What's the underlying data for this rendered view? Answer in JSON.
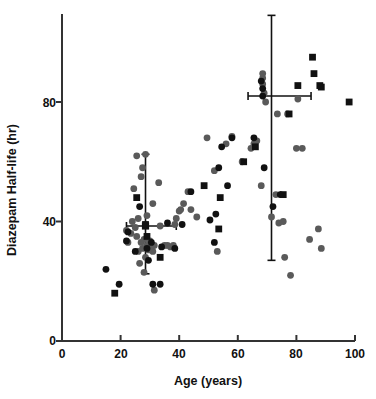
{
  "chart_data": {
    "type": "scatter",
    "title": "",
    "xlabel": "Age (years)",
    "ylabel": "Diazepam Half-life (hr)",
    "xlim": [
      0,
      100
    ],
    "ylim": [
      0,
      100
    ],
    "xticks": [
      0,
      20,
      40,
      60,
      80,
      100
    ],
    "yticks": [
      0,
      40,
      80
    ],
    "grid": false,
    "legend": "none",
    "series": [
      {
        "name": "gray-circles",
        "marker": "circle",
        "color": "#5a5a5a",
        "points": [
          [
            22.0,
            37.0
          ],
          [
            22.5,
            33.0
          ],
          [
            23.5,
            36.0
          ],
          [
            24.0,
            40.0
          ],
          [
            24.5,
            51.0
          ],
          [
            25.0,
            38.0
          ],
          [
            25.5,
            35.0
          ],
          [
            25.5,
            62.0
          ],
          [
            26.0,
            30.0
          ],
          [
            26.0,
            41.0
          ],
          [
            26.5,
            26.0
          ],
          [
            27.0,
            33.0
          ],
          [
            27.0,
            55.0
          ],
          [
            27.5,
            31.0
          ],
          [
            27.5,
            58.0
          ],
          [
            28.0,
            23.0
          ],
          [
            28.0,
            34.0
          ],
          [
            28.5,
            28.0
          ],
          [
            28.5,
            62.5
          ],
          [
            29.0,
            32.0
          ],
          [
            29.0,
            42.0
          ],
          [
            29.5,
            30.5
          ],
          [
            30.0,
            33.5
          ],
          [
            30.5,
            31.0
          ],
          [
            31.0,
            30.0
          ],
          [
            31.0,
            46.0
          ],
          [
            31.5,
            32.0
          ],
          [
            31.5,
            17.0
          ],
          [
            33.0,
            53.0
          ],
          [
            33.5,
            38.5
          ],
          [
            35.0,
            32.0
          ],
          [
            36.0,
            32.0
          ],
          [
            37.0,
            31.5
          ],
          [
            38.0,
            32.0
          ],
          [
            38.5,
            39.0
          ],
          [
            39.0,
            41.0
          ],
          [
            40.0,
            43.5
          ],
          [
            40.5,
            44.0
          ],
          [
            41.5,
            46.0
          ],
          [
            43.0,
            50.0
          ],
          [
            44.0,
            44.0
          ],
          [
            46.0,
            41.5
          ],
          [
            49.5,
            68.0
          ],
          [
            52.0,
            57.0
          ],
          [
            53.0,
            30.0
          ],
          [
            56.0,
            66.0
          ],
          [
            58.0,
            68.5
          ],
          [
            61.5,
            60.0
          ],
          [
            64.5,
            64.5
          ],
          [
            65.5,
            66.0
          ],
          [
            66.5,
            67.0
          ],
          [
            68.0,
            52.0
          ],
          [
            68.5,
            86.0
          ],
          [
            68.5,
            88.0
          ],
          [
            68.5,
            89.5
          ],
          [
            69.0,
            83.0
          ],
          [
            69.5,
            80.0
          ],
          [
            71.5,
            41.5
          ],
          [
            73.0,
            49.0
          ],
          [
            73.5,
            76.0
          ],
          [
            74.0,
            39.5
          ],
          [
            75.5,
            40.0
          ],
          [
            76.0,
            28.0
          ],
          [
            77.0,
            76.0
          ],
          [
            78.0,
            22.0
          ],
          [
            80.0,
            64.5
          ],
          [
            80.5,
            81.0
          ],
          [
            82.0,
            64.5
          ],
          [
            84.5,
            34.0
          ],
          [
            87.5,
            37.5
          ],
          [
            88.5,
            31.0
          ]
        ]
      },
      {
        "name": "black-circles",
        "marker": "circle",
        "color": "#111111",
        "points": [
          [
            15.0,
            24.0
          ],
          [
            19.5,
            19.0
          ],
          [
            22.0,
            33.5
          ],
          [
            22.5,
            36.5
          ],
          [
            25.0,
            30.0
          ],
          [
            26.5,
            45.0
          ],
          [
            29.0,
            31.0
          ],
          [
            29.5,
            27.0
          ],
          [
            30.5,
            33.0
          ],
          [
            31.0,
            19.0
          ],
          [
            33.5,
            19.0
          ],
          [
            34.0,
            31.5
          ],
          [
            36.0,
            39.5
          ],
          [
            38.5,
            31.0
          ],
          [
            41.0,
            39.0
          ],
          [
            44.0,
            50.0
          ],
          [
            50.5,
            40.5
          ],
          [
            52.0,
            33.0
          ],
          [
            52.5,
            42.5
          ],
          [
            53.5,
            58.0
          ],
          [
            54.5,
            65.0
          ],
          [
            56.5,
            52.0
          ],
          [
            58.0,
            68.0
          ],
          [
            65.5,
            68.0
          ],
          [
            68.0,
            87.0
          ],
          [
            68.5,
            82.0
          ],
          [
            68.5,
            84.5
          ],
          [
            69.0,
            58.0
          ],
          [
            72.0,
            45.0
          ],
          [
            74.5,
            49.0
          ]
        ]
      },
      {
        "name": "black-squares",
        "marker": "square",
        "color": "#111111",
        "points": [
          [
            18.0,
            16.0
          ],
          [
            25.5,
            48.0
          ],
          [
            28.5,
            39.0
          ],
          [
            29.0,
            35.0
          ],
          [
            33.5,
            28.0
          ],
          [
            48.5,
            52.0
          ],
          [
            53.5,
            37.5
          ],
          [
            54.0,
            48.0
          ],
          [
            62.0,
            60.0
          ],
          [
            66.0,
            65.0
          ],
          [
            75.5,
            49.0
          ],
          [
            77.5,
            76.0
          ],
          [
            80.5,
            85.5
          ],
          [
            85.5,
            95.0
          ],
          [
            86.0,
            89.5
          ],
          [
            88.0,
            85.5
          ],
          [
            88.5,
            85.0
          ],
          [
            98.0,
            80.0
          ]
        ]
      }
    ],
    "error_bars": [
      {
        "name": "young-group-mean",
        "x": 28.5,
        "y": 38.5,
        "y_low": 22.5,
        "y_high": 62.5,
        "x_low": 22.0,
        "x_high": 39.0,
        "marker": "square",
        "color": "#111111"
      },
      {
        "name": "elderly-group-mean",
        "x": 71.5,
        "y": 82.0,
        "y_low": 27.0,
        "y_high": 109.0,
        "x_low": 63.5,
        "x_high": 85.0,
        "marker": "none",
        "color": "#111111"
      }
    ],
    "axis_color": "#333333",
    "text_color": "#111111"
  },
  "axes": {
    "x_title": "Age (years)",
    "y_title": "Diazepam Half-life (hr)",
    "x_tick_labels": [
      "0",
      "20",
      "40",
      "60",
      "80",
      "100"
    ],
    "y_tick_labels": [
      "0",
      "40",
      "80"
    ]
  }
}
